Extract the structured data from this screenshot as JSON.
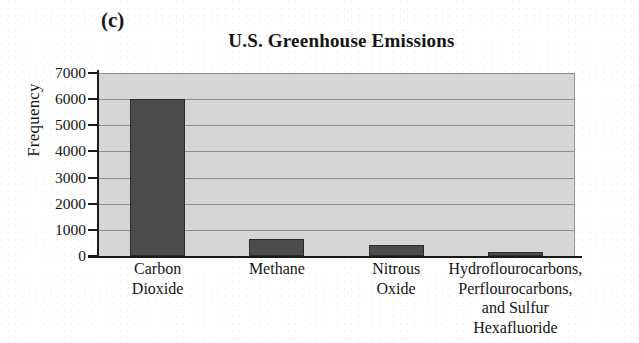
{
  "panel_label": "(c)",
  "chart_data": {
    "type": "bar",
    "title": "U.S. Greenhouse Emissions",
    "xlabel": "",
    "ylabel": "Frequency",
    "categories": [
      "Carbon\nDioxide",
      "Methane",
      "Nitrous\nOxide",
      "Hydroflourocarbons,\nPerflourocarbons,\nand Sulfur\nHexafluoride"
    ],
    "category_lines": [
      [
        "Carbon",
        "Dioxide"
      ],
      [
        "Methane"
      ],
      [
        "Nitrous",
        "Oxide"
      ],
      [
        "Hydroflourocarbons,",
        "Perflourocarbons,",
        "and Sulfur",
        "Hexafluoride"
      ]
    ],
    "values": [
      6000,
      650,
      430,
      150
    ],
    "ylim": [
      0,
      7000
    ],
    "yticks": [
      0,
      1000,
      2000,
      3000,
      4000,
      5000,
      6000,
      7000
    ],
    "ytick_labels": [
      "0",
      "1000",
      "2000",
      "3000",
      "4000",
      "5000",
      "6000",
      "7000"
    ],
    "grid": true,
    "legend": false,
    "bar_color": "#4c4c4c",
    "bar_edge_color": "#2b2b2b",
    "plot_background": "#d6d6d6",
    "gridline_color": "#8d8d8d",
    "axis_color": "#1a1a1a"
  }
}
